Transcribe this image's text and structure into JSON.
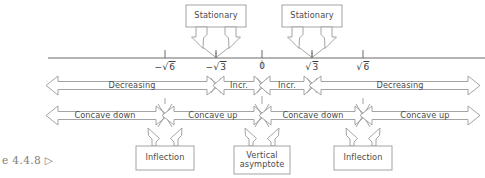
{
  "figure": {
    "caption": "e 4.4.8 ▷",
    "type": "sign-analysis-number-line"
  },
  "axis": {
    "label_0": "0",
    "ticks": [
      {
        "id": "neg-sqrt6",
        "value": -2.449,
        "sign": "−",
        "radicand": "6",
        "x": 165
      },
      {
        "id": "neg-sqrt3",
        "value": -1.732,
        "sign": "−",
        "radicand": "3",
        "x": 216
      },
      {
        "id": "zero",
        "value": 0,
        "sign": "",
        "radicand": "0",
        "x": 262
      },
      {
        "id": "pos-sqrt3",
        "value": 1.732,
        "sign": "",
        "radicand": "3",
        "x": 312
      },
      {
        "id": "pos-sqrt6",
        "value": 2.449,
        "sign": "",
        "radicand": "6",
        "x": 363
      }
    ]
  },
  "callouts": {
    "top": [
      {
        "id": "stationary-left",
        "label": "Stationary",
        "target": "neg-sqrt3"
      },
      {
        "id": "stationary-right",
        "label": "Stationary",
        "target": "pos-sqrt3"
      }
    ],
    "bottom": [
      {
        "id": "inflection-left",
        "label": "Inflection",
        "target": "neg-sqrt6"
      },
      {
        "id": "vertical-asymptote",
        "label": "Vertical\nasymptote",
        "line1": "Vertical",
        "line2": "asymptote",
        "target": "zero"
      },
      {
        "id": "inflection-right",
        "label": "Inflection",
        "target": "pos-sqrt6"
      }
    ]
  },
  "monotonicity_row": {
    "segments": [
      {
        "id": "dec-left",
        "label": "Decreasing",
        "from": "-inf",
        "to": "neg-sqrt3"
      },
      {
        "id": "incr-left",
        "label": "Incr.",
        "from": "neg-sqrt3",
        "to": "zero"
      },
      {
        "id": "incr-right",
        "label": "Incr.",
        "from": "zero",
        "to": "pos-sqrt3"
      },
      {
        "id": "dec-right",
        "label": "Decreasing",
        "from": "pos-sqrt3",
        "to": "+inf"
      }
    ]
  },
  "concavity_row": {
    "segments": [
      {
        "id": "cc-down-left",
        "label": "Concave down",
        "from": "-inf",
        "to": "neg-sqrt6"
      },
      {
        "id": "cc-up-left",
        "label": "Concave up",
        "from": "neg-sqrt6",
        "to": "zero"
      },
      {
        "id": "cc-down-right",
        "label": "Concave down",
        "from": "zero",
        "to": "pos-sqrt6"
      },
      {
        "id": "cc-up-right",
        "label": "Concave up",
        "from": "pos-sqrt6",
        "to": "+inf"
      }
    ]
  },
  "colors": {
    "stroke": "#9a9a9a",
    "axis": "#555555",
    "text": "#3d3d3d",
    "background": "#ffffff"
  }
}
